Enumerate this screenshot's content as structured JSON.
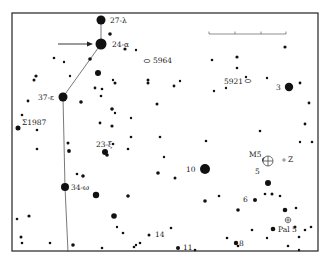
{
  "chart": {
    "frame": {
      "x": 12,
      "y": 13,
      "w": 306,
      "h": 238
    },
    "colors": {
      "ink": "#111111",
      "line": "#555555",
      "frame": "#222222",
      "bg": "#ffffff"
    },
    "labels": {
      "lambda": "27-λ",
      "alpha": "24-α",
      "epsilon": "37-ε",
      "omega": "34-ω",
      "xi": "23-ξ",
      "sigma": "Σ1987",
      "ngc5964": "5964",
      "ngc5921": "5921",
      "s3": "3",
      "s10": "10",
      "m5": "M5",
      "z": "Z",
      "s5": "5",
      "s6": "6",
      "pal5": "Pal 5",
      "s14": "14",
      "s11": "11",
      "s8": "8"
    },
    "constellation_line": [
      [
        101,
        20
      ],
      [
        101,
        44
      ],
      [
        63,
        97
      ],
      [
        65,
        187
      ],
      [
        68,
        252
      ]
    ],
    "pointer_arrow": {
      "x1": 58,
      "y1": 44,
      "x2": 93,
      "y2": 44
    },
    "scale_bar": {
      "x1": 209,
      "x2": 286,
      "y": 34,
      "ticks": [
        209,
        235,
        261,
        286
      ]
    },
    "stars": [
      [
        101,
        20,
        4.5
      ],
      [
        101,
        44,
        5.5
      ],
      [
        63,
        97,
        4.5
      ],
      [
        65,
        187,
        4
      ],
      [
        105,
        152,
        3
      ],
      [
        107,
        155,
        1.8
      ],
      [
        110,
        34,
        1.8
      ],
      [
        136,
        50,
        1.2
      ],
      [
        125,
        49,
        1.6
      ],
      [
        98,
        73,
        3
      ],
      [
        90,
        59,
        1.8
      ],
      [
        70,
        76,
        1.2
      ],
      [
        36,
        76,
        1.6
      ],
      [
        34,
        80,
        1.5
      ],
      [
        54,
        58,
        1.3
      ],
      [
        64,
        62,
        1.2
      ],
      [
        28,
        101,
        1.4
      ],
      [
        22,
        115,
        1.3
      ],
      [
        18,
        128,
        2.5
      ],
      [
        37,
        130,
        1.3
      ],
      [
        81,
        102,
        1.8
      ],
      [
        95,
        88,
        1.4
      ],
      [
        102,
        89,
        1.3
      ],
      [
        115,
        83,
        1.5
      ],
      [
        113,
        80,
        1.2
      ],
      [
        148,
        80,
        1.5
      ],
      [
        148,
        83,
        1.5
      ],
      [
        101,
        96,
        1.3
      ],
      [
        112,
        109,
        1.8
      ],
      [
        115,
        113,
        1.2
      ],
      [
        100,
        123,
        1.4
      ],
      [
        112,
        126,
        1.6
      ],
      [
        68,
        143,
        1.5
      ],
      [
        69,
        151,
        1.9
      ],
      [
        37,
        149,
        1.3
      ],
      [
        77,
        174,
        1.3
      ],
      [
        83,
        176,
        1.8
      ],
      [
        128,
        149,
        1.3
      ],
      [
        131,
        118,
        1.2
      ],
      [
        157,
        104,
        1.5
      ],
      [
        174,
        86,
        1.4
      ],
      [
        180,
        81,
        1.2
      ],
      [
        212,
        60,
        1.3
      ],
      [
        237,
        57,
        1.6
      ],
      [
        237,
        68,
        1.3
      ],
      [
        246,
        77,
        1.2
      ],
      [
        226,
        88,
        1.2
      ],
      [
        214,
        91,
        1.2
      ],
      [
        267,
        78,
        1.2
      ],
      [
        285,
        47,
        1.6
      ],
      [
        289,
        87,
        4.2
      ],
      [
        300,
        83,
        1.4
      ],
      [
        309,
        103,
        1.4
      ],
      [
        305,
        124,
        1.4
      ],
      [
        312,
        142,
        1.3
      ],
      [
        131,
        137,
        1.3
      ],
      [
        160,
        137,
        1.3
      ],
      [
        206,
        141,
        1.3
      ],
      [
        260,
        131,
        1.3
      ],
      [
        300,
        142,
        1.2
      ],
      [
        128,
        196,
        1.8
      ],
      [
        96,
        195,
        3.2
      ],
      [
        114,
        216,
        2.8
      ],
      [
        117,
        227,
        1.2
      ],
      [
        164,
        157,
        1.2
      ],
      [
        158,
        173,
        1.8
      ],
      [
        175,
        178,
        1.5
      ],
      [
        205,
        169,
        5
      ],
      [
        219,
        196,
        1.3
      ],
      [
        205,
        201,
        1.8
      ],
      [
        238,
        210,
        1.8
      ],
      [
        255,
        200,
        2
      ],
      [
        265,
        194,
        1.3
      ],
      [
        272,
        194,
        1.5
      ],
      [
        285,
        210,
        2.3
      ],
      [
        296,
        208,
        1.3
      ],
      [
        267,
        238,
        1.2
      ],
      [
        305,
        230,
        1.3
      ],
      [
        273,
        229,
        2.3
      ],
      [
        295,
        227,
        1.5
      ],
      [
        299,
        237,
        1.3
      ],
      [
        311,
        227,
        1.3
      ],
      [
        252,
        230,
        1.3
      ],
      [
        299,
        250,
        1.2
      ],
      [
        178,
        248,
        2
      ],
      [
        149,
        235,
        1.5
      ],
      [
        136,
        245,
        1.2
      ],
      [
        134,
        247,
        1.3
      ],
      [
        227,
        238,
        1.3
      ],
      [
        236,
        243,
        2.2
      ],
      [
        238,
        246,
        1.3
      ],
      [
        288,
        246,
        1.3
      ],
      [
        17,
        219,
        1.3
      ],
      [
        29,
        216,
        1.6
      ],
      [
        21,
        237,
        1.5
      ],
      [
        22,
        243,
        1.3
      ],
      [
        50,
        243,
        1.3
      ],
      [
        73,
        245,
        1.8
      ],
      [
        195,
        250,
        1.3
      ],
      [
        123,
        233,
        1.3
      ],
      [
        113,
        144,
        1.3
      ],
      [
        102,
        248,
        1.3
      ],
      [
        265,
        160,
        2.8
      ],
      [
        268,
        183,
        3
      ],
      [
        280,
        196,
        1.3
      ],
      [
        171,
        228,
        1.3
      ],
      [
        140,
        243,
        1.3
      ]
    ]
  }
}
